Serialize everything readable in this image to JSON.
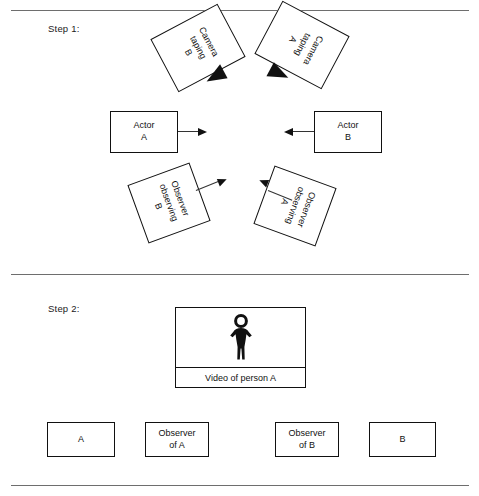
{
  "figure": {
    "steps": [
      {
        "label": "Step 1:"
      },
      {
        "label": "Step 2:"
      }
    ],
    "step1": {
      "cameras": [
        {
          "text": "Camera\ntaping\nB",
          "icon": "camera-lens-icon"
        },
        {
          "text": "Camera\ntaping\nA",
          "icon": "camera-lens-icon"
        }
      ],
      "actors": [
        {
          "text": "Actor\nA",
          "arrow": "arrow-right-icon"
        },
        {
          "text": "Actor\nB",
          "arrow": "arrow-left-icon"
        }
      ],
      "observers": [
        {
          "text": "Observer\nobserving\nB",
          "arrow": "arrow-up-right-icon"
        },
        {
          "text": "Observer\nobserving\nA",
          "arrow": "arrow-up-left-icon"
        }
      ]
    },
    "step2": {
      "monitor": {
        "caption": "Video of person A",
        "icon": "person-figure-icon"
      },
      "participants": [
        {
          "text": "A"
        },
        {
          "text": "Observer\nof A"
        },
        {
          "text": "Observer\nof B"
        },
        {
          "text": "B"
        }
      ]
    },
    "colors": {
      "ink": "#111111",
      "rule": "#6e6e6e",
      "background": "#ffffff"
    }
  }
}
